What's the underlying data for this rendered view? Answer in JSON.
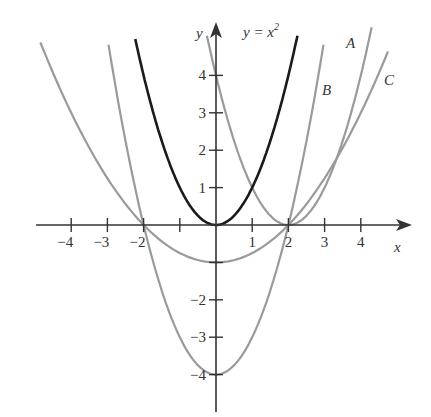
{
  "chart_data": {
    "type": "line",
    "title": "",
    "xlabel": "x",
    "ylabel": "y",
    "xlim": [
      -5,
      5.3
    ],
    "ylim": [
      -5,
      5.1
    ],
    "grid": false,
    "x_ticks": [
      -4,
      -3,
      -2,
      -1,
      1,
      2,
      3,
      4
    ],
    "x_tick_labels": [
      "−4",
      "−3",
      "−2",
      "",
      "1",
      "2",
      "3",
      "4"
    ],
    "y_ticks": [
      -4,
      -3,
      -2,
      -1,
      1,
      2,
      3,
      4
    ],
    "y_tick_labels": [
      "−4",
      "−3",
      "−2",
      "",
      "1",
      "2",
      "3",
      "4"
    ],
    "series": [
      {
        "name": "y = x^2",
        "label": "y = x",
        "label_sup": "2",
        "formula": "x^2",
        "x_range": [
          -2.23,
          2.25
        ],
        "color": "#1a1a1a",
        "width": 2.6
      },
      {
        "name": "A",
        "label": "A",
        "formula": "(x-2)^2",
        "x_range": [
          -0.25,
          4.3
        ],
        "color": "#9a9a9a",
        "width": 2.2
      },
      {
        "name": "B",
        "label": "B",
        "formula": "x^2-4",
        "x_range": [
          -2.97,
          2.97
        ],
        "color": "#9a9a9a",
        "width": 2.2
      },
      {
        "name": "C",
        "label": "C",
        "formula": "x^2/4-1",
        "x_range": [
          -4.85,
          4.75
        ],
        "color": "#9a9a9a",
        "width": 2.2
      }
    ],
    "annotations": [
      {
        "text": "y = x²",
        "near": "top of y = x^2"
      },
      {
        "text": "A",
        "near": "upper right of (x-2)^2"
      },
      {
        "text": "B",
        "near": "right branch of x^2-4"
      },
      {
        "text": "C",
        "near": "right branch of x^2/4-1"
      }
    ]
  },
  "labels": {
    "x_axis": "x",
    "y_axis": "y",
    "curve_main_base": "y = x",
    "curve_main_sup": "2",
    "curve_a": "A",
    "curve_b": "B",
    "curve_c": "C"
  }
}
